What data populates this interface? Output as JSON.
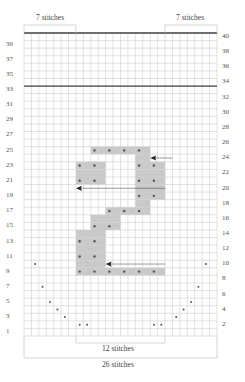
{
  "diagram": {
    "type": "knitting-chart",
    "columns": 26,
    "rows": 40,
    "colors": {
      "grid_line": "#cfcfcf",
      "shade": "#c9c9c9",
      "dot": "#555555",
      "frame": "#666666",
      "thick_line": "#444444"
    },
    "labels": {
      "top_left": "7 stitches",
      "top_right": "7 stitches",
      "bottom_inner": "12 stitches",
      "bottom_outer": "26 stitches"
    },
    "left_row_numbers": [
      "39",
      "37",
      "35",
      "33",
      "31",
      "29",
      "27",
      "25",
      "23",
      "21",
      "19",
      "17",
      "15",
      "13",
      "11",
      "9",
      "7",
      "5",
      "3",
      "1"
    ],
    "right_row_numbers": [
      "40",
      "38",
      "36",
      "34",
      "32",
      "30",
      "28",
      "26",
      "24",
      "22",
      "20",
      "18",
      "16",
      "14",
      "12",
      "10",
      "8",
      "6",
      "4",
      "2"
    ],
    "thick_lines_after_rows": [
      40,
      33
    ],
    "shaded_cells": [
      {
        "row": 25,
        "cols": [
          10,
          17
        ]
      },
      {
        "row": 24,
        "cols": [
          16,
          17
        ]
      },
      {
        "row": 23,
        "cols": [
          8,
          11
        ]
      },
      {
        "row": 23,
        "cols": [
          16,
          19
        ]
      },
      {
        "row": 22,
        "cols": [
          8,
          11
        ]
      },
      {
        "row": 22,
        "cols": [
          16,
          19
        ]
      },
      {
        "row": 21,
        "cols": [
          8,
          11
        ]
      },
      {
        "row": 21,
        "cols": [
          16,
          19
        ]
      },
      {
        "row": 20,
        "cols": [
          16,
          19
        ]
      },
      {
        "row": 19,
        "cols": [
          16,
          19
        ]
      },
      {
        "row": 18,
        "cols": [
          16,
          17
        ]
      },
      {
        "row": 17,
        "cols": [
          12,
          17
        ]
      },
      {
        "row": 16,
        "cols": [
          10,
          13
        ]
      },
      {
        "row": 15,
        "cols": [
          10,
          13
        ]
      },
      {
        "row": 14,
        "cols": [
          8,
          11
        ]
      },
      {
        "row": 13,
        "cols": [
          8,
          11
        ]
      },
      {
        "row": 12,
        "cols": [
          8,
          11
        ]
      },
      {
        "row": 11,
        "cols": [
          8,
          11
        ]
      },
      {
        "row": 10,
        "cols": [
          8,
          11
        ]
      },
      {
        "row": 9,
        "cols": [
          8,
          19
        ]
      }
    ],
    "shaded_dots": [
      {
        "row": 25,
        "cols": [
          10,
          12,
          14,
          16
        ]
      },
      {
        "row": 23,
        "cols": [
          8,
          10,
          16,
          18
        ]
      },
      {
        "row": 21,
        "cols": [
          8,
          10,
          16,
          18
        ]
      },
      {
        "row": 19,
        "cols": [
          16,
          18
        ]
      },
      {
        "row": 17,
        "cols": [
          12,
          14,
          16
        ]
      },
      {
        "row": 15,
        "cols": [
          10,
          12
        ]
      },
      {
        "row": 13,
        "cols": [
          8,
          10
        ]
      },
      {
        "row": 11,
        "cols": [
          8,
          10
        ]
      },
      {
        "row": 9,
        "cols": [
          8,
          10,
          12,
          14,
          16,
          18
        ]
      }
    ],
    "plain_dots": [
      {
        "row": 10,
        "cols": [
          2,
          25
        ]
      },
      {
        "row": 7,
        "cols": [
          3,
          24
        ]
      },
      {
        "row": 5,
        "cols": [
          4,
          23
        ]
      },
      {
        "row": 4,
        "cols": [
          5,
          22
        ]
      },
      {
        "row": 3,
        "cols": [
          6,
          21
        ]
      },
      {
        "row": 2,
        "cols": [
          8,
          9,
          18,
          19
        ]
      }
    ],
    "arrows": [
      {
        "row": 24,
        "from_col": 20,
        "to_col": 18,
        "direction": "left"
      },
      {
        "row": 20,
        "from_col": 19,
        "to_col": 8,
        "direction": "left"
      },
      {
        "row": 10,
        "from_col": 19,
        "to_col": 12,
        "direction": "left"
      }
    ]
  }
}
